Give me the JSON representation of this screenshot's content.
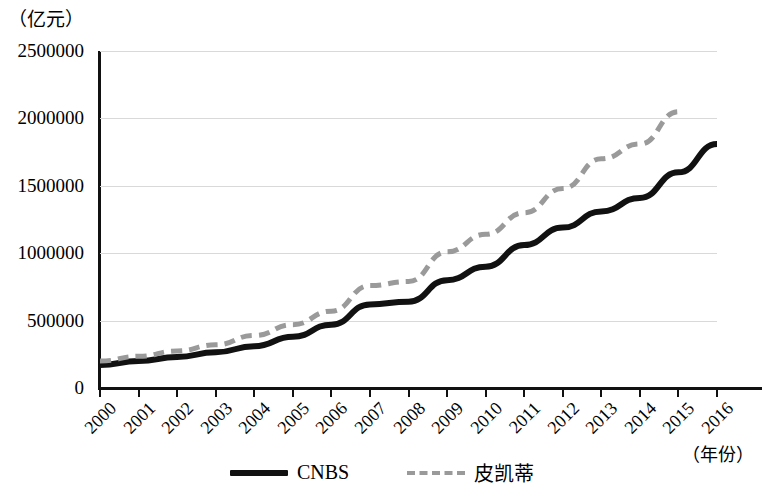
{
  "chart_data": {
    "type": "line",
    "title": "",
    "xlabel": "（年份）",
    "ylabel": "（亿元）",
    "x": [
      2000,
      2001,
      2002,
      2003,
      2004,
      2005,
      2006,
      2007,
      2008,
      2009,
      2010,
      2011,
      2012,
      2013,
      2014,
      2015,
      2016
    ],
    "categories": [
      "2000",
      "2001",
      "2002",
      "2003",
      "2004",
      "2005",
      "2006",
      "2007",
      "2008",
      "2009",
      "2010",
      "2011",
      "2012",
      "2013",
      "2014",
      "2015",
      "2016"
    ],
    "xlim": [
      2000,
      2016
    ],
    "ylim": [
      0,
      2500000
    ],
    "yticks": [
      0,
      500000,
      1000000,
      1500000,
      2000000,
      2500000
    ],
    "ytick_labels": [
      "0",
      "500000",
      "1000000",
      "1500000",
      "2000000",
      "2500000"
    ],
    "grid": true,
    "grid_axis": "y",
    "legend_position": "bottom-center",
    "series": [
      {
        "name": "CNBS",
        "style": "solid",
        "color": "#111111",
        "width": 6,
        "values": [
          170000,
          200000,
          230000,
          265000,
          310000,
          380000,
          470000,
          620000,
          640000,
          800000,
          900000,
          1060000,
          1190000,
          1310000,
          1410000,
          1600000,
          1810000
        ]
      },
      {
        "name": "皮凯蒂",
        "style": "dashed",
        "color": "#9a9a9a",
        "width": 5,
        "values": [
          200000,
          235000,
          275000,
          320000,
          390000,
          470000,
          570000,
          760000,
          790000,
          1010000,
          1140000,
          1300000,
          1480000,
          1700000,
          1810000,
          2050000,
          null
        ]
      }
    ]
  },
  "legend": {
    "items": [
      {
        "label": "CNBS",
        "style": "solid",
        "color": "#111111"
      },
      {
        "label": "皮凯蒂",
        "style": "dashed",
        "color": "#9a9a9a"
      }
    ]
  },
  "axes": {
    "y_unit": "（亿元）",
    "x_unit": "（年份）"
  }
}
